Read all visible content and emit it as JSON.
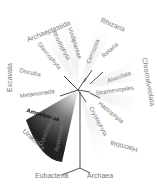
{
  "diagram": {
    "type": "radial-phylogenetic-tree",
    "supergroups": [
      {
        "name": "Archaeplastida",
        "clades": [
          "Viridiplantae",
          "Rhodophyta",
          "Glaucophyta"
        ]
      },
      {
        "name": "Rhizaria",
        "clades": [
          "Cercozoa",
          "Retaria"
        ]
      },
      {
        "name": "Chromalveolata",
        "clades": [
          "Alveolata",
          "Stramenopiles",
          "Haptophyta",
          "Cryptophyta"
        ]
      },
      {
        "name": "Excavata",
        "clades": [
          "Discoba",
          "Metamonada"
        ]
      },
      {
        "name": "Unikonta",
        "clades": [
          "Amoebozoa",
          "Opisthokonta",
          "Apusozoa"
        ]
      },
      {
        "name": "Hacrobia",
        "clades": []
      }
    ],
    "labels": {
      "archaeplastida": "Archaeplastida",
      "viridiplantae": "Viridiplantae",
      "rhodophyta": "Rhodophyta",
      "glaucophyta": "Glaucophyta",
      "rhizaria": "Rhizaria",
      "cercozoa": "Cercozoa",
      "retaria": "Retaria",
      "chromalveolata": "Chromalveolata",
      "alveolata": "Alveolata",
      "stramenopiles": "Stramenopiles",
      "haptophyta": "Haptophyta",
      "cryptophyta": "Cryptophyta",
      "hacrobia": "Hacrobia",
      "excavata": "Excavata",
      "discoba": "Discoba",
      "metamonada": "Metamonada",
      "unikonta": "Unikonta",
      "amoebozoa": "Amoebozoa",
      "opisthokonta": "Opisthokonta",
      "apusozoa": "Apusozoa",
      "eubacteria": "Eubacteria",
      "archaea": "Archaea"
    },
    "colors": {
      "highlight": "#333333",
      "label": "#777777",
      "background": "#ffffff"
    }
  }
}
